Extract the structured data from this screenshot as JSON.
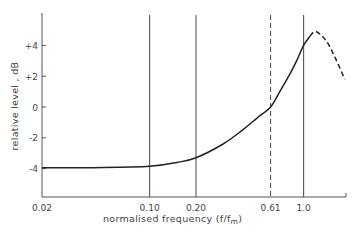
{
  "chart_data": {
    "type": "line",
    "title": "",
    "xlabel": "normalised frequency (f/f_m)",
    "xlabel_main": "normalised frequency (f/f",
    "xlabel_sub": "m",
    "xlabel_close": ")",
    "ylabel": "relative level , dB",
    "xscale": "log",
    "xlim": [
      0.02,
      1.9
    ],
    "ylim": [
      -6,
      6
    ],
    "grid": false,
    "legend": null,
    "x_ticks": [
      {
        "value": 0.02,
        "label": "0.02"
      },
      {
        "value": 0.1,
        "label": "0.10"
      },
      {
        "value": 0.2,
        "label": "0.20"
      },
      {
        "value": 0.61,
        "label": "0.61"
      },
      {
        "value": 1.0,
        "label": "1.0"
      }
    ],
    "y_ticks": [
      {
        "value": 4,
        "label": "+4"
      },
      {
        "value": 2,
        "label": "+2"
      },
      {
        "value": 0,
        "label": "0"
      },
      {
        "value": -2,
        "label": "-2"
      },
      {
        "value": -4,
        "label": "-4"
      }
    ],
    "reference_lines": [
      {
        "x": 0.1,
        "style": "solid"
      },
      {
        "x": 0.2,
        "style": "solid"
      },
      {
        "x": 0.61,
        "style": "dashed"
      },
      {
        "x": 1.0,
        "style": "solid"
      }
    ],
    "series": [
      {
        "name": "response (measured)",
        "style": "solid",
        "x": [
          0.02,
          0.05,
          0.1,
          0.15,
          0.2,
          0.3,
          0.4,
          0.5,
          0.61,
          0.7,
          0.8,
          0.9,
          1.0,
          1.1
        ],
        "values": [
          -3.95,
          -3.93,
          -3.85,
          -3.6,
          -3.3,
          -2.4,
          -1.5,
          -0.7,
          0.0,
          1.0,
          2.0,
          3.0,
          4.0,
          4.6
        ]
      },
      {
        "name": "response (extrapolated)",
        "style": "dashed",
        "x": [
          1.1,
          1.2,
          1.4,
          1.6,
          1.85
        ],
        "values": [
          4.6,
          4.9,
          4.3,
          3.2,
          1.8
        ]
      }
    ]
  }
}
